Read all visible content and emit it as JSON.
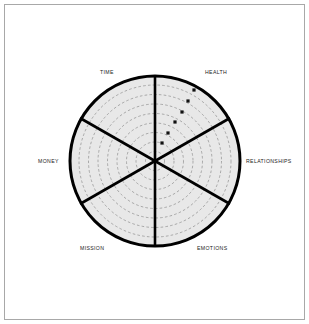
{
  "page": {
    "background_color": "#ffffff",
    "frame_color": "#a8a8a8",
    "width": 309,
    "height": 324
  },
  "chart_data": {
    "type": "pie",
    "subtype": "wheel-of-life-radar",
    "title": "",
    "subtitle": "",
    "xlabel": "",
    "ylabel": "",
    "legend_position": "none",
    "grid": true,
    "grid_style": "dashed-concentric-rings",
    "ring_count": 9,
    "sector_count": 6,
    "axis_range": [
      0,
      10
    ],
    "center": {
      "x": 155,
      "y": 161
    },
    "radius": 86,
    "colors": {
      "sector_fill": "#e8e8e8",
      "outline": "#000000",
      "spoke": "#000000",
      "ring": "#8c8c8c",
      "marker": "#111111",
      "label_text": "#1a1a1a"
    },
    "categories": [
      {
        "label": "TIME",
        "angle_deg": 120,
        "label_x": 100,
        "label_y": 74,
        "anchor": "start"
      },
      {
        "label": "HEALTH",
        "angle_deg": 60,
        "label_x": 205,
        "label_y": 74,
        "anchor": "start"
      },
      {
        "label": "MONEY",
        "angle_deg": 180,
        "label_x": 38,
        "label_y": 163,
        "anchor": "start"
      },
      {
        "label": "RELATIONSHIPS",
        "angle_deg": 0,
        "label_x": 246,
        "label_y": 163,
        "anchor": "start"
      },
      {
        "label": "MISSION",
        "angle_deg": 240,
        "label_x": 80,
        "label_y": 250,
        "anchor": "start"
      },
      {
        "label": "EMOTIONS",
        "angle_deg": 300,
        "label_x": 197,
        "label_y": 250,
        "anchor": "start"
      }
    ],
    "spokes": [
      {
        "x1": 155,
        "y1": 75,
        "x2": 155,
        "y2": 247
      },
      {
        "x1": 80,
        "y1": 118,
        "x2": 230,
        "y2": 204
      },
      {
        "x1": 230,
        "y1": 118,
        "x2": 80,
        "y2": 204
      }
    ],
    "rings": [
      9.5,
      19,
      28.5,
      38,
      47.5,
      57,
      66.5,
      76,
      85.5
    ],
    "series": [
      {
        "name": "plotted-points",
        "sector": "HEALTH",
        "points": [
          {
            "label": "",
            "x": 194,
            "y": 90,
            "value": 8.5
          },
          {
            "label": "",
            "x": 188,
            "y": 101,
            "value": 7.2
          },
          {
            "label": "",
            "x": 182,
            "y": 112,
            "value": 5.9
          },
          {
            "label": "",
            "x": 175,
            "y": 122,
            "value": 4.6
          },
          {
            "label": "",
            "x": 168,
            "y": 133,
            "value": 3.3
          },
          {
            "label": "",
            "x": 162,
            "y": 143,
            "value": 2.1
          }
        ]
      }
    ]
  }
}
